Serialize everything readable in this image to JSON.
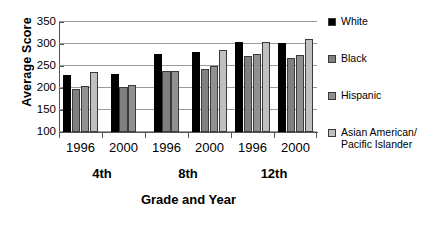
{
  "chart_data": {
    "type": "bar",
    "title": "",
    "xlabel": "Grade and Year",
    "ylabel": "Average Score",
    "ylim": [
      100,
      350
    ],
    "yticks": [
      100,
      150,
      200,
      250,
      300,
      350
    ],
    "grid": true,
    "legend_position": "right",
    "categories": [
      "1996",
      "2000",
      "1996",
      "2000",
      "1996",
      "2000"
    ],
    "group_labels": [
      "4th",
      "8th",
      "12th"
    ],
    "series": [
      {
        "name": "White",
        "color": "#000000",
        "values": [
          230,
          232,
          277,
          282,
          305,
          303
        ]
      },
      {
        "name": "Black",
        "color": "#808080",
        "values": [
          197,
          203,
          238,
          244,
          272,
          269
        ]
      },
      {
        "name": "Hispanic",
        "color": "#919191",
        "values": [
          205,
          206,
          238,
          249,
          278,
          274
        ]
      },
      {
        "name": "Asian American/\nPacific Islander",
        "color": "#c0c0c0",
        "values": [
          236,
          null,
          null,
          286,
          304,
          312
        ]
      }
    ]
  },
  "axis": {
    "y_label": "Average Score",
    "x_label": "Grade and Year",
    "y_ticks": [
      "350",
      "300",
      "250",
      "200",
      "150",
      "100"
    ]
  },
  "x_groups": [
    {
      "year": "1996",
      "grade": "4th"
    },
    {
      "year": "2000",
      "grade": "4th"
    },
    {
      "year": "1996",
      "grade": "8th"
    },
    {
      "year": "2000",
      "grade": "8th"
    },
    {
      "year": "1996",
      "grade": "12th"
    },
    {
      "year": "2000",
      "grade": "12th"
    }
  ],
  "grade_labels": [
    "4th",
    "8th",
    "12th"
  ],
  "legend": {
    "items": [
      {
        "label": "White",
        "color": "#000000"
      },
      {
        "label": "Black",
        "color": "#808080"
      },
      {
        "label": "Hispanic",
        "color": "#919191"
      },
      {
        "label": "Asian American/\nPacific Islander",
        "color": "#c0c0c0"
      }
    ]
  }
}
